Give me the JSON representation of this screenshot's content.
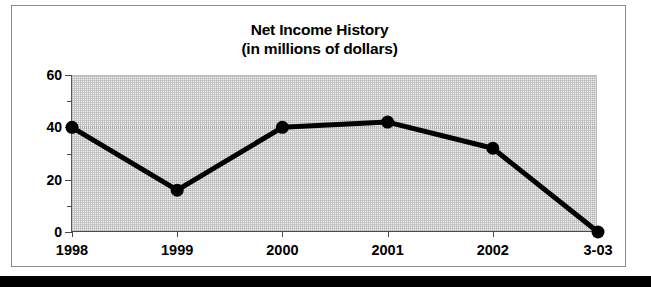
{
  "chart_data": {
    "type": "line",
    "title": "Net Income History",
    "subtitle": "(in millions of dollars)",
    "xlabel": "",
    "ylabel": "",
    "categories": [
      "1998",
      "1999",
      "2000",
      "2001",
      "2002",
      "3-03"
    ],
    "values": [
      40,
      16,
      40,
      42,
      32,
      0
    ],
    "series": [
      {
        "name": "Net Income",
        "values": [
          40,
          16,
          40,
          42,
          32,
          0
        ]
      }
    ],
    "ylim": [
      0,
      60
    ],
    "yticks": [
      0,
      20,
      40,
      60
    ],
    "ytick_labels": [
      "0",
      "20",
      "40",
      "60"
    ],
    "yticks_minor": [
      10,
      30,
      50
    ],
    "grid": true,
    "gridlines_at": [
      20,
      40
    ],
    "legend": "none",
    "marker": "filled-circle",
    "line_color": "#000000",
    "marker_color": "#000000",
    "plot_background": "#f2f2f2"
  },
  "chart": {
    "title": "Net Income History",
    "subtitle": "(in millions of dollars)"
  },
  "axes": {
    "y": {
      "labels": [
        "60",
        "40",
        "20",
        "0"
      ],
      "values": [
        60,
        40,
        20,
        0
      ]
    },
    "x": {
      "labels": [
        "1998",
        "1999",
        "2000",
        "2001",
        "2002",
        "3-03"
      ]
    }
  },
  "points": [
    {
      "x": "1998",
      "y": 40
    },
    {
      "x": "1999",
      "y": 16
    },
    {
      "x": "2000",
      "y": 40
    },
    {
      "x": "2001",
      "y": 42
    },
    {
      "x": "2002",
      "y": 32
    },
    {
      "x": "3-03",
      "y": 0
    }
  ],
  "colors": {
    "line": "#000000",
    "plot_bg": "#f2f2f2",
    "frame": "#8c8c8c",
    "bar": "#000000"
  }
}
